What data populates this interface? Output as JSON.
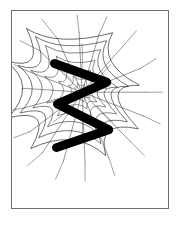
{
  "page": {
    "width": 182,
    "height": 226,
    "background_color": "#ffffff",
    "title": "Spider web with bold zigzag stroke"
  },
  "frame": {
    "name": "picture-frame",
    "x": 11,
    "y": 10,
    "width": 158,
    "height": 199,
    "border_color": "#6f6f72",
    "border_width": 1,
    "fill_color": "#ffffff"
  },
  "artwork": {
    "caption": "Hand drawn spider web overlaid by a thick black zigzag",
    "web": {
      "name": "spider-web",
      "stroke_color": "#2a2a2a",
      "center_x": 82,
      "center_y": 92,
      "radius_x": 62,
      "radius_y": 52,
      "spoke_count": 14,
      "ring_count": 7,
      "line_width_min": 0.35,
      "line_width_max": 0.9
    },
    "zigzag": {
      "name": "zigzag-stroke",
      "color": "#000000",
      "stroke_width": 9,
      "line_cap": "round",
      "line_join": "round",
      "points": [
        [
          54,
          63
        ],
        [
          107,
          82
        ],
        [
          57,
          104
        ],
        [
          109,
          130
        ],
        [
          56,
          148
        ]
      ]
    }
  }
}
